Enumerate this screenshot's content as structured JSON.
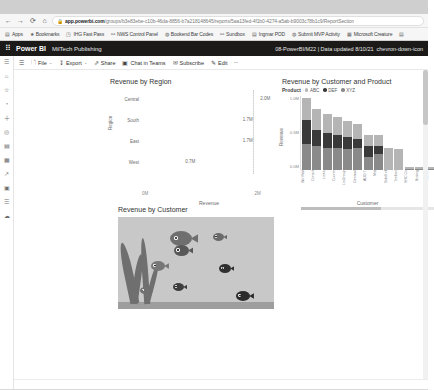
{
  "browser": {
    "nav": {
      "back": "←",
      "forward": "→",
      "reload": "⟳",
      "home": "⌂"
    },
    "address": {
      "lock_icon": "lock-icon",
      "domain": "app.powerbi.com",
      "path": "/groups/b3e83ebe-c10b-46da-8856-b7a218148645/reports/5aa13fed-4f1b0-4274-a5ab-b9003c78b1c9/ReportSection"
    },
    "bookmarks": [
      {
        "icon": "apps-icon",
        "label": "Apps"
      },
      {
        "icon": "star-icon",
        "label": "Bookmarks"
      },
      {
        "icon": "doc-icon",
        "label": "IHG Fast Pass"
      },
      {
        "icon": "link-icon",
        "label": "NWS Control Panel"
      },
      {
        "icon": "globe-icon",
        "label": "Bookend Bar Codes"
      },
      {
        "icon": "link-icon",
        "label": "Sundbox"
      },
      {
        "icon": "doc-icon",
        "label": "Ingmar POD"
      },
      {
        "icon": "globe-icon",
        "label": "Submit MVP Activity"
      },
      {
        "icon": "grid-icon",
        "label": "Microsoft Creature"
      },
      {
        "icon": "more-icon",
        "label": ""
      }
    ]
  },
  "pbi_header": {
    "waffle_icon": "app-launcher-icon",
    "brand": "Power BI",
    "workspace": "MilTech Publishing",
    "report_info": "08-PowerBI/M22  |  Data updated 8/10/21",
    "chevron_icon": "chevron-down-icon"
  },
  "leftnav": {
    "items": [
      {
        "icon": "hamburger-icon",
        "name": "nav-toggle"
      },
      {
        "icon": "home-icon",
        "name": "nav-home"
      },
      {
        "icon": "star-icon",
        "name": "nav-favorites"
      },
      {
        "icon": "clock-icon",
        "name": "nav-recent"
      },
      {
        "icon": "plus-icon",
        "name": "nav-create"
      },
      {
        "icon": "target-icon",
        "name": "nav-goals"
      },
      {
        "icon": "book-icon",
        "name": "nav-apps"
      },
      {
        "icon": "grid-icon",
        "name": "nav-datahub"
      },
      {
        "icon": "share-icon",
        "name": "nav-shared"
      },
      {
        "icon": "briefcase-icon",
        "name": "nav-workspaces"
      },
      {
        "icon": "database-icon",
        "name": "nav-datasets"
      },
      {
        "icon": "cloud-icon",
        "name": "nav-deploy"
      }
    ]
  },
  "ribbon": {
    "menu_icon": "hamburger-icon",
    "items": [
      {
        "icon": "file-icon",
        "label": "File",
        "caret": "⌄"
      },
      {
        "icon": "export-icon",
        "label": "Export",
        "caret": "⌄"
      },
      {
        "icon": "share-icon",
        "label": "Share",
        "caret": ""
      },
      {
        "icon": "teams-icon",
        "label": "Chat in Teams",
        "caret": ""
      },
      {
        "icon": "subscribe-icon",
        "label": "Subscribe",
        "caret": ""
      },
      {
        "icon": "edit-icon",
        "label": "Edit",
        "caret": ""
      },
      {
        "icon": "more-icon",
        "label": "",
        "caret": "⋯"
      }
    ]
  },
  "chart_data": [
    {
      "type": "bar",
      "title": "Revenue by Region",
      "xlabel": "Revenue",
      "ylabel": "Region",
      "categories": [
        "Central",
        "South",
        "East",
        "West"
      ],
      "values": [
        2.0,
        1.7,
        1.7,
        0.7
      ],
      "data_labels": [
        "2.0M",
        "1.7M",
        "1.7M",
        "0.7M"
      ],
      "xticks": [
        "0M",
        "2M"
      ],
      "xlim": [
        0,
        2.3
      ],
      "grid": true,
      "bar_color": "#a0a0a0"
    },
    {
      "type": "bar",
      "title": "Revenue by Customer and Product",
      "legend_title": "Product",
      "legend_position": "top",
      "xlabel": "Customer",
      "ylabel": "Revenue",
      "yticks": [
        "1.0M",
        "0.5M",
        "0.0M"
      ],
      "ylim": [
        0,
        1.0
      ],
      "stacked": true,
      "categories": [
        "Wir Marl",
        "Consol",
        "Lines",
        "Cuorro",
        "LinGroup",
        "Genmal",
        "ADD T",
        "Mid",
        "Sidell of",
        "Toolbec",
        "SRC Co",
        "Bosing",
        "Luomi"
      ],
      "series": [
        {
          "name": "ABC",
          "color": "#b5b5b5",
          "values": [
            0.3,
            0.28,
            0.26,
            0.24,
            0.22,
            0.2,
            0.16,
            0.15,
            0.3,
            0.28,
            0.02,
            0.02,
            0.02
          ]
        },
        {
          "name": "DEF",
          "color": "#3a3a3a",
          "values": [
            0.32,
            0.22,
            0.2,
            0.18,
            0.16,
            0.12,
            0.14,
            0.1,
            0.0,
            0.0,
            0.01,
            0.01,
            0.01
          ]
        },
        {
          "name": "XYZ",
          "color": "#8a8a8a",
          "values": [
            0.35,
            0.32,
            0.3,
            0.3,
            0.28,
            0.3,
            0.18,
            0.22,
            0.0,
            0.0,
            0.01,
            0.01,
            0.01
          ]
        }
      ]
    }
  ],
  "fish_visual": {
    "title": "Revenue by Customer",
    "fish": [
      {
        "label": "1",
        "size": "large"
      },
      {
        "label": "2",
        "size": "medium"
      },
      {
        "label": "3",
        "size": "medium"
      },
      {
        "label": "4",
        "size": "small"
      },
      {
        "label": "5",
        "size": "small"
      },
      {
        "label": "6",
        "size": "small"
      },
      {
        "label": "7",
        "size": "small"
      },
      {
        "label": "8",
        "size": "small"
      }
    ]
  }
}
